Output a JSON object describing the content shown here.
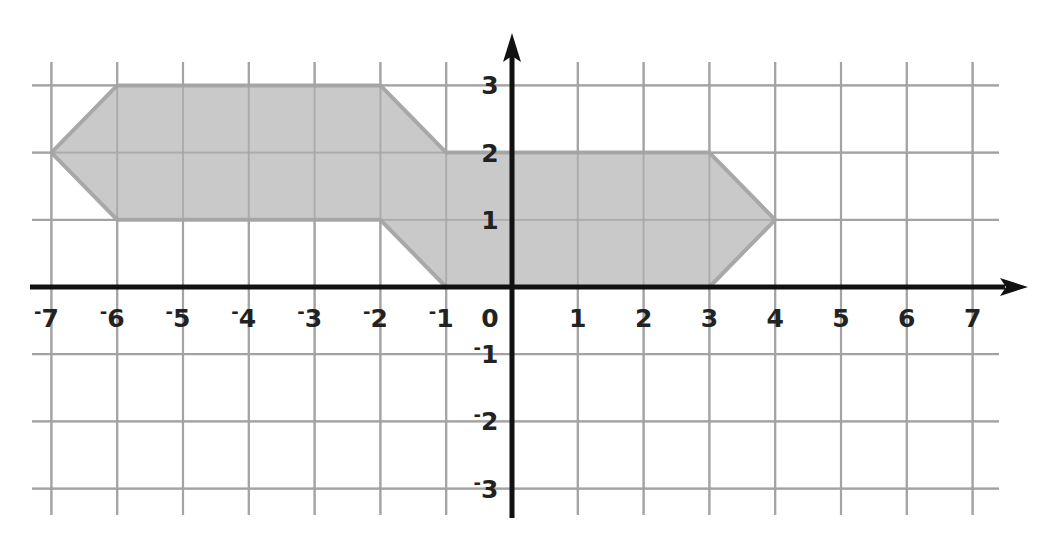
{
  "chart_data": {
    "type": "coordinate-grid-polygon",
    "title": "",
    "xlabel": "",
    "ylabel": "",
    "xlim": [
      -7,
      7
    ],
    "ylim": [
      -3,
      3
    ],
    "grid": true,
    "x_ticks": [
      -7,
      -6,
      -5,
      -4,
      -3,
      -2,
      -1,
      0,
      1,
      2,
      3,
      4,
      5,
      6,
      7
    ],
    "y_ticks": [
      3,
      2,
      1,
      -1,
      -2,
      -3
    ],
    "x_tick_labels": [
      "-7",
      "-6",
      "-5",
      "-4",
      "-3",
      "-2",
      "-1",
      "0",
      "1",
      "2",
      "3",
      "4",
      "5",
      "6",
      "7"
    ],
    "y_tick_labels": [
      "3",
      "2",
      "1",
      "-1",
      "-2",
      "-3"
    ],
    "polygon": {
      "vertices": [
        [
          -7,
          2
        ],
        [
          -6,
          3
        ],
        [
          -2,
          3
        ],
        [
          -1,
          2
        ],
        [
          3,
          2
        ],
        [
          4,
          1
        ],
        [
          3,
          0
        ],
        [
          -1,
          0
        ],
        [
          -2,
          1
        ],
        [
          -6,
          1
        ]
      ],
      "fill": "#c4c4c4",
      "stroke": "#a8a8a8"
    }
  },
  "colors": {
    "grid": "#a3a3a3",
    "axis": "#111111",
    "label": "#222222",
    "background": "#ffffff"
  },
  "layout": {
    "origin_px": [
      512,
      287
    ],
    "unit_x_px": 65.8,
    "unit_y_px": 67.2
  }
}
